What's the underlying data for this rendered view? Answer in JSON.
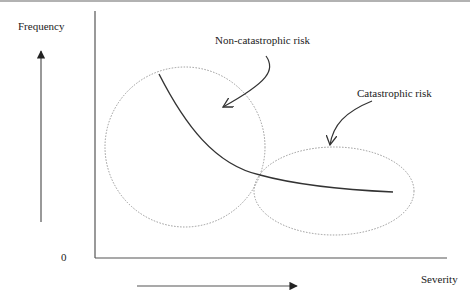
{
  "diagram": {
    "y_axis_label": "Frequency",
    "x_axis_label": "Severity",
    "origin_label": "0",
    "annotations": {
      "non_catastrophic": "Non-catastrophic risk",
      "catastrophic": "Catastrophic risk"
    },
    "colors": {
      "axis": "#555555",
      "curve": "#333333",
      "region_outline": "#999999",
      "arrow": "#333333",
      "text": "#222222"
    },
    "elements": {
      "frequency_arrow": "upward arrow indicating increasing frequency",
      "severity_arrow": "rightward arrow indicating increasing severity",
      "risk_curve": "decreasing convex curve of frequency vs severity",
      "non_catastrophic_region": "dotted circle around high-frequency low-severity part of the curve",
      "catastrophic_region": "dotted ellipse around low-frequency high-severity tail of the curve"
    }
  }
}
